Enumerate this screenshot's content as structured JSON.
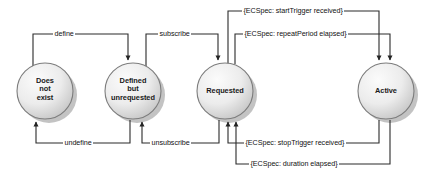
{
  "diagram": {
    "type": "state-machine",
    "background": "#ffffff",
    "node_fill_light": "#f2f2f2",
    "node_fill_dark": "#c9c9c9",
    "node_stroke": "#7d7d7d",
    "shadow_color": "#b5b5b5",
    "line_color": "#2b2b2b",
    "text_color": "#111111",
    "states": [
      {
        "id": "does-not-exist",
        "label": "Does\nnot\nexist",
        "cx": 45,
        "cy": 91,
        "r": 28
      },
      {
        "id": "defined-but-unrequested",
        "label": "Defined\nbut\nunrequested",
        "cx": 133,
        "cy": 91,
        "r": 28
      },
      {
        "id": "requested",
        "label": "Requested",
        "cx": 225,
        "cy": 91,
        "r": 28
      },
      {
        "id": "active",
        "label": "Active",
        "cx": 386,
        "cy": 91,
        "r": 28
      }
    ],
    "transitions": [
      {
        "id": "define",
        "label": "define",
        "from": "does-not-exist",
        "to": "defined-but-unrequested",
        "route": "top"
      },
      {
        "id": "subscribe",
        "label": "subscribe",
        "from": "defined-but-unrequested",
        "to": "requested",
        "route": "top"
      },
      {
        "id": "start-trigger",
        "label": "{ECSpec: startTrigger received}",
        "from": "requested",
        "to": "active",
        "route": "top"
      },
      {
        "id": "repeat-period",
        "label": "{ECSpec: repeatPeriod elapsed}",
        "from": "requested",
        "to": "active",
        "route": "top"
      },
      {
        "id": "undefine",
        "label": "undefine",
        "from": "defined-but-unrequested",
        "to": "does-not-exist",
        "route": "bottom"
      },
      {
        "id": "unsubscribe",
        "label": "unsubscribe",
        "from": "requested",
        "to": "defined-but-unrequested",
        "route": "bottom"
      },
      {
        "id": "stop-trigger",
        "label": "{ECSpec: stopTrigger received}",
        "from": "active",
        "to": "requested",
        "route": "bottom"
      },
      {
        "id": "duration",
        "label": "{ECSpec: duration elapsed}",
        "from": "active",
        "to": "requested",
        "route": "bottom"
      }
    ]
  }
}
